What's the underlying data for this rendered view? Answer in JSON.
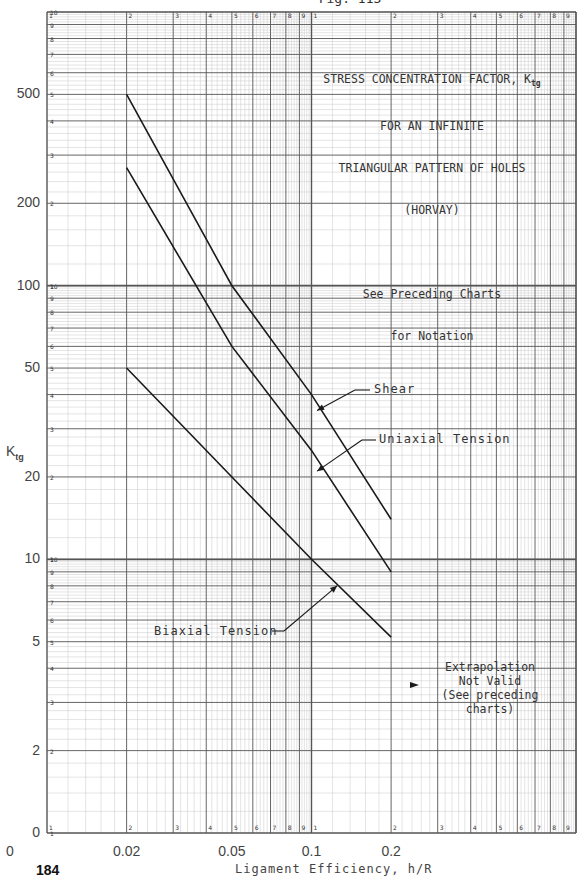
{
  "header": {
    "figure_id": "Fig. 113"
  },
  "page": {
    "number": "184"
  },
  "chart_data": {
    "type": "line",
    "title": "STRESS CONCENTRATION FACTOR, Ktg FOR AN INFINITE TRIANGULAR PATTERN OF HOLES (HORVAY)",
    "title_lines": [
      "STRESS CONCENTRATION FACTOR, K",
      "FOR AN INFINITE",
      "TRIANGULAR PATTERN OF HOLES",
      "(HORVAY)"
    ],
    "title_subscript": "tg",
    "subtitle_lines": [
      "See Preceding Charts",
      "for Notation"
    ],
    "xlabel": "Ligament Efficiency, h/R",
    "ylabel": "K",
    "ylabel_subscript": "tg",
    "xscale": "log",
    "yscale": "log",
    "xlim": [
      0.01,
      1.0
    ],
    "ylim": [
      1,
      1000
    ],
    "grid": true,
    "x_tick_labels": [
      {
        "value": 0.01,
        "label": "0"
      },
      {
        "value": 0.02,
        "label": "0.02"
      },
      {
        "value": 0.05,
        "label": "0.05"
      },
      {
        "value": 0.1,
        "label": "0.1"
      },
      {
        "value": 0.2,
        "label": "0.2"
      }
    ],
    "y_tick_labels": [
      {
        "value": 1,
        "label": "0"
      },
      {
        "value": 2,
        "label": "2"
      },
      {
        "value": 5,
        "label": "5"
      },
      {
        "value": 10,
        "label": "10"
      },
      {
        "value": 20,
        "label": "20"
      },
      {
        "value": 50,
        "label": "50"
      },
      {
        "value": 100,
        "label": "100"
      },
      {
        "value": 200,
        "label": "200"
      },
      {
        "value": 500,
        "label": "500"
      }
    ],
    "series": [
      {
        "name": "Shear",
        "x": [
          0.02,
          0.05,
          0.1,
          0.2
        ],
        "y": [
          500,
          100,
          40,
          14
        ]
      },
      {
        "name": "Uniaxial Tension",
        "x": [
          0.02,
          0.05,
          0.1,
          0.2
        ],
        "y": [
          270,
          60,
          25,
          9
        ]
      },
      {
        "name": "Biaxial Tension",
        "x": [
          0.02,
          0.05,
          0.1,
          0.2
        ],
        "y": [
          50,
          20,
          10,
          5.2
        ]
      }
    ],
    "annotations": [
      {
        "text": "Shear",
        "arrow_to": [
          0.105,
          35
        ]
      },
      {
        "text": "Uniaxial Tension",
        "arrow_to": [
          0.105,
          21
        ]
      },
      {
        "text": "Biaxial Tension",
        "arrow_to": [
          0.125,
          8
        ]
      },
      {
        "text": "Extrapolation\nNot Valid\n(See preceding\ncharts)",
        "arrow": "left"
      }
    ],
    "legend_position": "none"
  }
}
